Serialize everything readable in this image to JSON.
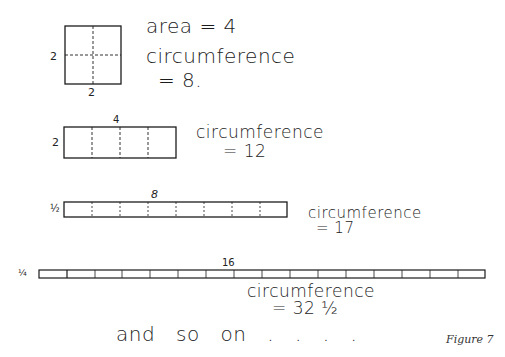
{
  "figure": {
    "caption": "Figure 7",
    "closing_text": "and so on . . . ."
  },
  "shapes": [
    {
      "id": "square",
      "side_label": "2",
      "bottom_label": "2",
      "area_text": "area = 4",
      "circ_label": "circumference",
      "circ_value": "= 8.",
      "divisions": 2
    },
    {
      "id": "rect-4x2",
      "side_label": "2",
      "top_label": "4",
      "circ_label": "circumference",
      "circ_value": "= 12",
      "divisions": 4
    },
    {
      "id": "rect-8xhalf",
      "side_label": "½",
      "top_label": "8",
      "circ_label": "circumference",
      "circ_value": "= 17",
      "divisions": 8
    },
    {
      "id": "rect-16xquarter",
      "side_label": "¼",
      "top_label": "16",
      "circ_label": "circumference",
      "circ_value": "= 32 ½",
      "divisions": 16
    }
  ],
  "colors": {
    "ink": "#1c1c1c",
    "background": "#ffffff"
  }
}
